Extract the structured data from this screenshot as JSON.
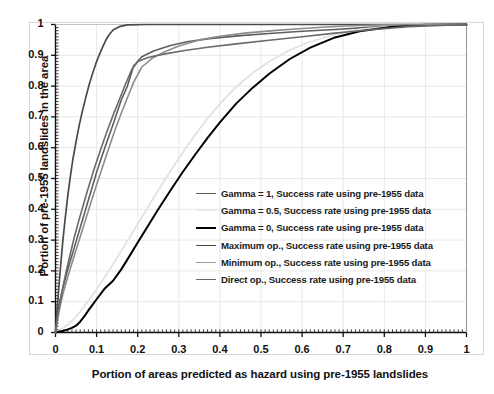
{
  "chart_data": {
    "type": "line",
    "title": "",
    "xlabel": "Portion of areas predicted as hazard using pre-1955 landslides",
    "ylabel": "Portion of pre-1955 landslides in the area",
    "xlim": [
      0,
      1
    ],
    "ylim": [
      0,
      1
    ],
    "xticks": [
      "0",
      "0.1",
      "0.2",
      "0.3",
      "0.4",
      "0.5",
      "0.6",
      "0.7",
      "0.8",
      "0.9",
      "1"
    ],
    "yticks": [
      "0",
      "0.1",
      "0.2",
      "0.3",
      "0.4",
      "0.5",
      "0.6",
      "0.7",
      "0.8",
      "0.9",
      "1"
    ],
    "xtick_values": [
      0,
      0.1,
      0.2,
      0.3,
      0.4,
      0.5,
      0.6,
      0.7,
      0.8,
      0.9,
      1
    ],
    "ytick_values": [
      0,
      0.1,
      0.2,
      0.3,
      0.4,
      0.5,
      0.6,
      0.7,
      0.8,
      0.9,
      1
    ],
    "minor_tick_step": 0.01,
    "grid": true,
    "grid_color": "#e8e8e8",
    "legend_position": "lower-right-inside",
    "series": [
      {
        "name": "Gamma = 1, Success rate using pre-1955 data",
        "color": "#5e5e5e",
        "width": 1.6,
        "x": [
          0,
          0.005,
          0.01,
          0.02,
          0.03,
          0.04,
          0.05,
          0.06,
          0.07,
          0.08,
          0.09,
          0.1,
          0.12,
          0.14,
          0.16,
          0.175,
          0.19,
          0.21,
          0.24,
          0.28,
          0.32,
          0.38,
          0.45,
          0.52,
          0.6,
          0.68,
          0.75,
          0.82,
          0.9,
          1.0
        ],
        "y": [
          0,
          0.055,
          0.1,
          0.155,
          0.205,
          0.25,
          0.295,
          0.34,
          0.385,
          0.43,
          0.475,
          0.52,
          0.6,
          0.675,
          0.755,
          0.8,
          0.865,
          0.895,
          0.915,
          0.932,
          0.944,
          0.955,
          0.964,
          0.971,
          0.978,
          0.984,
          0.99,
          0.995,
          0.999,
          1.0
        ]
      },
      {
        "name": "Gamma = 0.5, Success rate using pre-1955 data",
        "color": "#e2e2e2",
        "width": 1.8,
        "x": [
          0,
          0.01,
          0.02,
          0.03,
          0.04,
          0.05,
          0.06,
          0.07,
          0.08,
          0.1,
          0.12,
          0.14,
          0.16,
          0.18,
          0.2,
          0.22,
          0.25,
          0.28,
          0.31,
          0.34,
          0.37,
          0.4,
          0.44,
          0.48,
          0.52,
          0.57,
          0.62,
          0.68,
          0.74,
          0.82,
          0.9,
          1.0
        ],
        "y": [
          0,
          0.008,
          0.016,
          0.026,
          0.038,
          0.052,
          0.068,
          0.085,
          0.102,
          0.14,
          0.18,
          0.222,
          0.265,
          0.308,
          0.352,
          0.396,
          0.462,
          0.525,
          0.585,
          0.642,
          0.695,
          0.742,
          0.798,
          0.843,
          0.88,
          0.917,
          0.944,
          0.968,
          0.984,
          0.995,
          0.999,
          1.0
        ]
      },
      {
        "name": "Gamma = 0, Success rate using pre-1955 data",
        "color": "#000000",
        "width": 2.0,
        "x": [
          0,
          0.01,
          0.02,
          0.03,
          0.04,
          0.05,
          0.06,
          0.07,
          0.08,
          0.09,
          0.1,
          0.12,
          0.14,
          0.16,
          0.18,
          0.2,
          0.22,
          0.25,
          0.28,
          0.31,
          0.34,
          0.37,
          0.4,
          0.44,
          0.48,
          0.52,
          0.57,
          0.62,
          0.68,
          0.74,
          0.82,
          0.9,
          1.0
        ],
        "y": [
          0,
          0.003,
          0.006,
          0.01,
          0.015,
          0.022,
          0.035,
          0.052,
          0.072,
          0.09,
          0.108,
          0.143,
          0.168,
          0.205,
          0.248,
          0.292,
          0.335,
          0.4,
          0.462,
          0.522,
          0.578,
          0.632,
          0.682,
          0.744,
          0.795,
          0.84,
          0.888,
          0.925,
          0.958,
          0.978,
          0.993,
          0.999,
          1.0
        ]
      },
      {
        "name": "Maximum op., Success rate using pre-1955 data",
        "color": "#4a4a4a",
        "width": 1.7,
        "x": [
          0,
          0.004,
          0.008,
          0.013,
          0.018,
          0.024,
          0.03,
          0.036,
          0.042,
          0.05,
          0.058,
          0.066,
          0.074,
          0.082,
          0.09,
          0.098,
          0.106,
          0.114,
          0.122,
          0.13,
          0.14,
          0.155,
          0.175,
          0.22,
          0.3,
          0.45,
          0.65,
          0.85,
          1.0
        ],
        "y": [
          0,
          0.075,
          0.145,
          0.225,
          0.3,
          0.375,
          0.445,
          0.505,
          0.56,
          0.62,
          0.675,
          0.722,
          0.765,
          0.805,
          0.84,
          0.872,
          0.9,
          0.925,
          0.948,
          0.966,
          0.982,
          0.993,
          0.999,
          1.0,
          1.0,
          1.0,
          1.0,
          1.0,
          1.0
        ]
      },
      {
        "name": "Minimum op., Success rate using pre-1955 data",
        "color": "#8c8c8c",
        "width": 1.6,
        "x": [
          0,
          0.006,
          0.012,
          0.02,
          0.03,
          0.04,
          0.05,
          0.06,
          0.07,
          0.08,
          0.09,
          0.1,
          0.115,
          0.13,
          0.145,
          0.16,
          0.175,
          0.19,
          0.21,
          0.235,
          0.26,
          0.3,
          0.35,
          0.4,
          0.46,
          0.53,
          0.6,
          0.66,
          0.72,
          0.8,
          0.9,
          1.0
        ],
        "y": [
          0,
          0.048,
          0.09,
          0.135,
          0.182,
          0.225,
          0.268,
          0.31,
          0.352,
          0.395,
          0.438,
          0.48,
          0.54,
          0.6,
          0.658,
          0.712,
          0.762,
          0.812,
          0.862,
          0.89,
          0.908,
          0.93,
          0.95,
          0.962,
          0.972,
          0.98,
          0.987,
          0.992,
          0.996,
          0.999,
          1.0,
          1.0
        ]
      },
      {
        "name": "Direct op., Success rate using pre-1955 data",
        "color": "#6a6a6a",
        "width": 1.6,
        "x": [
          0,
          0.005,
          0.011,
          0.018,
          0.026,
          0.035,
          0.045,
          0.055,
          0.065,
          0.075,
          0.085,
          0.095,
          0.11,
          0.125,
          0.14,
          0.155,
          0.17,
          0.185,
          0.2,
          0.225,
          0.26,
          0.31,
          0.37,
          0.44,
          0.52,
          0.6,
          0.68,
          0.76,
          0.86,
          1.0
        ],
        "y": [
          0,
          0.052,
          0.098,
          0.148,
          0.198,
          0.25,
          0.305,
          0.355,
          0.402,
          0.448,
          0.492,
          0.535,
          0.595,
          0.652,
          0.705,
          0.755,
          0.805,
          0.852,
          0.88,
          0.893,
          0.903,
          0.915,
          0.926,
          0.937,
          0.949,
          0.96,
          0.972,
          0.982,
          0.993,
          1.0
        ]
      }
    ]
  },
  "legend": {
    "items": [
      {
        "label": "Gamma = 1, Success rate using pre-1955 data",
        "color": "#5e5e5e",
        "width": 1.6
      },
      {
        "label": "Gamma = 0.5, Success rate using pre-1955 data",
        "color": "#e8e8e8",
        "width": 1.8
      },
      {
        "label": "Gamma = 0, Success rate using pre-1955 data",
        "color": "#000000",
        "width": 2.2
      },
      {
        "label": "Maximum op., Success rate using pre-1955 data",
        "color": "#4a4a4a",
        "width": 1.8
      },
      {
        "label": "Minimum op., Success rate using pre-1955 data",
        "color": "#9a9a9a",
        "width": 1.7
      },
      {
        "label": "Direct op., Success rate using pre-1955 data",
        "color": "#6a6a6a",
        "width": 1.8
      }
    ]
  }
}
